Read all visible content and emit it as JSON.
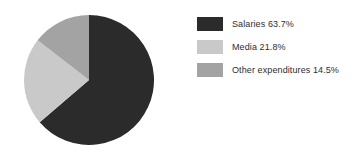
{
  "chart_data": {
    "type": "pie",
    "title": "",
    "categories": [
      "Salaries",
      "Media",
      "Other expenditures"
    ],
    "values": [
      63.7,
      21.8,
      14.5
    ],
    "value_unit": "%",
    "labels": [
      "Salaries 63.7%",
      "Media 21.8%",
      "Other expenditures 14.5%"
    ],
    "colors": [
      "#2b2b2b",
      "#c9c9c9",
      "#a3a3a3"
    ],
    "legend_position": "right",
    "grid": false,
    "start_angle_deg": 0,
    "direction": "clockwise"
  },
  "legend": {
    "rows": [
      {
        "label": "Salaries 63.7%",
        "color": "#2b2b2b"
      },
      {
        "label": "Media 21.8%",
        "color": "#c9c9c9"
      },
      {
        "label": "Other expenditures 14.5%",
        "color": "#a3a3a3"
      }
    ]
  },
  "background": "#ffffff"
}
